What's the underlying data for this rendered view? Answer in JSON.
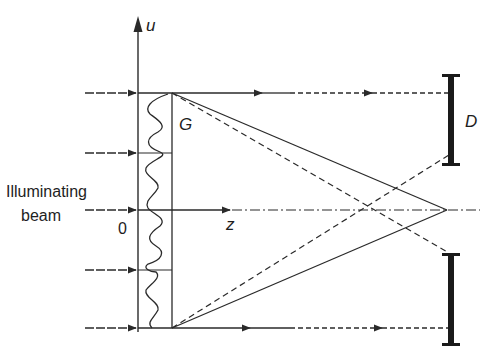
{
  "diagram": {
    "type": "optics-schematic",
    "labels": {
      "vertical_axis": "u",
      "horizontal_axis": "z",
      "origin": "0",
      "grating": "G",
      "detector": "D",
      "beam_line1": "Illuminating",
      "beam_line2": "beam"
    },
    "colors": {
      "line": "#2a2a2a",
      "detector": "#1a1a1a",
      "background": "#ffffff"
    },
    "geometry": {
      "u_axis_x": 138,
      "grating_right_x": 172,
      "beam_y": [
        93,
        153,
        210,
        270,
        328
      ],
      "focus_point": [
        447,
        210
      ],
      "detector_x": 451,
      "detector_top_bar": [
        75,
        165
      ],
      "detector_bottom_bar": [
        253,
        345
      ]
    }
  }
}
